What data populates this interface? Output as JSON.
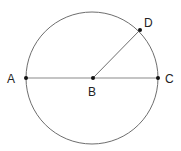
{
  "diagram": {
    "type": "circle-geometry",
    "circle": {
      "cx": 92,
      "cy": 78,
      "r": 66,
      "stroke": "#6e6e6e"
    },
    "points": [
      {
        "id": "A",
        "label": "A",
        "x": 26,
        "y": 78,
        "label_x": 7,
        "label_y": 83
      },
      {
        "id": "B",
        "label": "B",
        "x": 93,
        "y": 78,
        "label_x": 88,
        "label_y": 96
      },
      {
        "id": "C",
        "label": "C",
        "x": 158,
        "y": 78,
        "label_x": 165,
        "label_y": 83
      },
      {
        "id": "D",
        "label": "D",
        "x": 140,
        "y": 30,
        "label_x": 144,
        "label_y": 27
      }
    ],
    "segments": [
      {
        "from": "A",
        "to": "C",
        "name": "diameter-AC",
        "stroke": "#8a8a8a"
      },
      {
        "from": "B",
        "to": "D",
        "name": "radius-BD",
        "stroke": "#6e6e6e"
      }
    ]
  }
}
